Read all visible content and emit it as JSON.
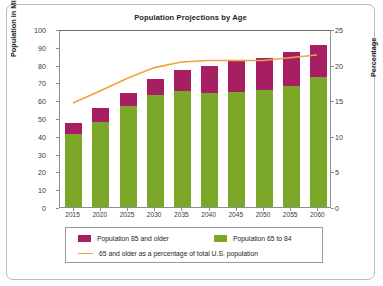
{
  "figure": {
    "title": "Population Projections by Age"
  },
  "axes": {
    "left_label": "Population in Millions",
    "right_label": "Percentage",
    "left_ticks": [
      "0",
      "10",
      "20",
      "30",
      "40",
      "50",
      "60",
      "70",
      "80",
      "90",
      "100"
    ],
    "right_ticks": [
      "0",
      "5",
      "10",
      "15",
      "20",
      "25"
    ],
    "x_ticks": [
      "2015",
      "2020",
      "2025",
      "2030",
      "2035",
      "2040",
      "2045",
      "2050",
      "2055",
      "2060"
    ]
  },
  "legend": {
    "items": [
      {
        "label": "Population 85 and older",
        "marker": "swatch",
        "color": "#a81e63"
      },
      {
        "label": "Population 65 to 84",
        "marker": "swatch",
        "color": "#7ba828"
      },
      {
        "label": "65 and older as a percentage of total U.S. population",
        "marker": "line",
        "color": "#efa33c"
      }
    ]
  },
  "chart_data": {
    "type": "bar",
    "title": "Population Projections by Age",
    "xlabel": "",
    "ylabel": "Population in Millions",
    "y2label": "Percentage",
    "ylim": [
      0,
      100
    ],
    "y2lim": [
      0,
      25
    ],
    "grid": false,
    "legend_position": "bottom",
    "stacked": true,
    "categories": [
      "2015",
      "2020",
      "2025",
      "2030",
      "2035",
      "2040",
      "2045",
      "2050",
      "2055",
      "2060"
    ],
    "series": [
      {
        "name": "Population 65 to 84",
        "axis": "left",
        "type": "bar",
        "color": "#7ba828",
        "values": [
          41.0,
          48.0,
          57.0,
          63.0,
          65.0,
          64.0,
          64.5,
          65.5,
          68.0,
          73.0
        ]
      },
      {
        "name": "Population 85 and older",
        "axis": "left",
        "type": "bar",
        "color": "#a81e63",
        "values": [
          6.0,
          7.5,
          7.0,
          9.0,
          12.0,
          15.5,
          17.5,
          18.5,
          19.0,
          18.0
        ]
      },
      {
        "name": "65 and older as a percentage of total U.S. population",
        "axis": "right",
        "type": "line",
        "color": "#efa33c",
        "values": [
          14.8,
          16.5,
          18.3,
          19.8,
          20.6,
          20.8,
          20.8,
          20.8,
          21.2,
          21.6
        ]
      }
    ],
    "totals": [
      47.0,
      55.5,
      64.0,
      72.0,
      77.0,
      79.5,
      82.0,
      84.0,
      87.0,
      91.0
    ]
  }
}
